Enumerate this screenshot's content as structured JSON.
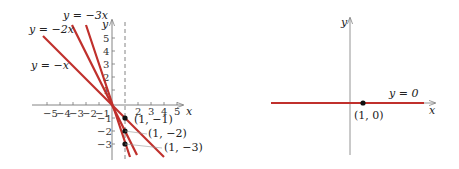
{
  "colors": {
    "line": "#c0302c",
    "axis": "#777777",
    "point": "#111111",
    "text": "#222222"
  },
  "left_graph": {
    "axis_labels": {
      "x": "x",
      "y": "y"
    },
    "x_ticks": [
      "−5",
      "−4",
      "−3",
      "−2",
      "−1",
      "2",
      "3",
      "4",
      "5"
    ],
    "y_ticks": [
      "5",
      "4",
      "3",
      "2",
      "1",
      "−1",
      "−2",
      "−3"
    ],
    "dashed_line": "x = 1",
    "lines": [
      {
        "label": "y = −x",
        "slope": -1
      },
      {
        "label": "y = −2x",
        "slope": -2
      },
      {
        "label": "y = −3x",
        "slope": -3
      }
    ],
    "points": [
      {
        "label": "(1, −1)"
      },
      {
        "label": "(1, −2)"
      },
      {
        "label": "(1, −3)"
      }
    ]
  },
  "right_graph": {
    "axis_labels": {
      "x": "x",
      "y": "y"
    },
    "line": {
      "label": "y = 0",
      "slope": 0
    },
    "point": {
      "label": "(1, 0)"
    }
  }
}
